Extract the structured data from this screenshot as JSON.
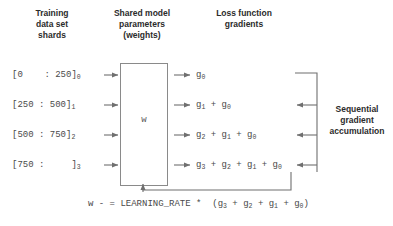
{
  "diagram": {
    "title_shards": "Training\ndata set\nshards",
    "title_params": "Shared model\nparameters\n(weights)",
    "title_grads": "Loss function\ngradients",
    "side_label": "Sequential\ngradient\naccumulation",
    "weights_symbol": "w",
    "shards": [
      {
        "label": "[0    : 250]",
        "index": "0"
      },
      {
        "label": "[250 : 500]",
        "index": "1"
      },
      {
        "label": "[500 : 750]",
        "index": "2"
      },
      {
        "label": "[750 :     ]",
        "index": "3"
      }
    ],
    "gradients": [
      {
        "terms": [
          "g0"
        ]
      },
      {
        "terms": [
          "g1",
          "g0"
        ]
      },
      {
        "terms": [
          "g2",
          "g1",
          "g0"
        ]
      },
      {
        "terms": [
          "g3",
          "g2",
          "g1",
          "g0"
        ]
      }
    ],
    "gradient_rows": [
      "g_0",
      "g_1 + g_0",
      "g_2 + g_1 + g_0",
      "g_3 + g_2 + g_1 + g_0"
    ],
    "update_rule": {
      "variable": "w",
      "operator": "- =",
      "hyperparameter": "LEARNING_RATE",
      "multiply": "*",
      "sum": "(g_3 + g_2 + g_1 + g_0)"
    },
    "colors": {
      "line": "#8a8a8a",
      "text": "#3a3a3a",
      "mono_text": "#4a4a4a",
      "background": "#ffffff"
    }
  }
}
